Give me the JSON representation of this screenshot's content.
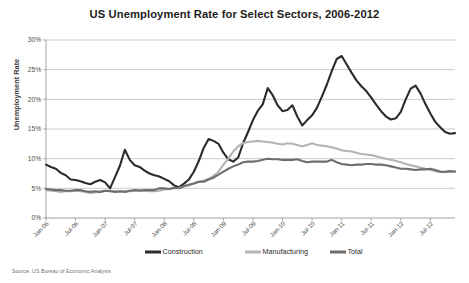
{
  "chart_data": {
    "type": "line",
    "title": "US Unemployment Rate for Select Sectors, 2006-2012",
    "xlabel": "",
    "ylabel": "Unemployment Rate",
    "source": "Source: US Bureau of Economic Analysis",
    "ylim": [
      0,
      30
    ],
    "ytick_labels": [
      "0%",
      "5%",
      "10%",
      "15%",
      "20%",
      "25%",
      "30%"
    ],
    "ytick_values": [
      0,
      5,
      10,
      15,
      20,
      25,
      30
    ],
    "grid": true,
    "legend_position": "bottom",
    "x_start": "Jan-06",
    "x_end": "Jul-12",
    "x_step_months": 6,
    "xtick_labels": [
      "Jan-06",
      "Jul-06",
      "Jan-07",
      "Jul-07",
      "Jan-08",
      "Jul-08",
      "Jan-09",
      "Jul-09",
      "Jan-10",
      "Jul-10",
      "Jan-11",
      "Jul-11",
      "Jan-12",
      "Jul-12"
    ],
    "x": [
      "Jan-06",
      "Feb-06",
      "Mar-06",
      "Apr-06",
      "May-06",
      "Jun-06",
      "Jul-06",
      "Aug-06",
      "Sep-06",
      "Oct-06",
      "Nov-06",
      "Dec-06",
      "Jan-07",
      "Feb-07",
      "Mar-07",
      "Apr-07",
      "May-07",
      "Jun-07",
      "Jul-07",
      "Aug-07",
      "Sep-07",
      "Oct-07",
      "Nov-07",
      "Dec-07",
      "Jan-08",
      "Feb-08",
      "Mar-08",
      "Apr-08",
      "May-08",
      "Jun-08",
      "Jul-08",
      "Aug-08",
      "Sep-08",
      "Oct-08",
      "Nov-08",
      "Dec-08",
      "Jan-09",
      "Feb-09",
      "Mar-09",
      "Apr-09",
      "May-09",
      "Jun-09",
      "Jul-09",
      "Aug-09",
      "Sep-09",
      "Oct-09",
      "Nov-09",
      "Dec-09",
      "Jan-10",
      "Feb-10",
      "Mar-10",
      "Apr-10",
      "May-10",
      "Jun-10",
      "Jul-10",
      "Aug-10",
      "Sep-10",
      "Oct-10",
      "Nov-10",
      "Dec-10",
      "Jan-11",
      "Feb-11",
      "Mar-11",
      "Apr-11",
      "May-11",
      "Jun-11",
      "Jul-11",
      "Aug-11",
      "Sep-11",
      "Oct-11",
      "Nov-11",
      "Dec-11",
      "Jan-12",
      "Feb-12",
      "Mar-12",
      "Apr-12",
      "May-12",
      "Jun-12",
      "Jul-12",
      "Aug-12",
      "Sep-12",
      "Oct-12",
      "Nov-12",
      "Dec-12"
    ],
    "series": [
      {
        "name": "Construction",
        "color": "#2b2b2b",
        "width": 2.1,
        "values": [
          9.0,
          8.6,
          8.3,
          7.6,
          7.2,
          6.5,
          6.4,
          6.2,
          5.9,
          5.7,
          6.1,
          6.4,
          6.0,
          5.0,
          6.9,
          8.8,
          11.5,
          9.8,
          8.9,
          8.6,
          8.0,
          7.5,
          7.2,
          7.0,
          6.6,
          6.2,
          5.5,
          5.2,
          5.8,
          6.5,
          7.8,
          9.6,
          11.8,
          13.3,
          13.0,
          12.5,
          11.0,
          9.9,
          9.5,
          10.2,
          12.6,
          14.5,
          16.5,
          18.1,
          19.2,
          21.9,
          20.7,
          19.0,
          18.0,
          18.2,
          19.0,
          17.1,
          15.6,
          16.5,
          17.3,
          18.6,
          20.5,
          22.5,
          24.8,
          26.8,
          27.3,
          25.9,
          24.5,
          23.2,
          22.2,
          21.4,
          20.3,
          19.1,
          18.0,
          17.1,
          16.6,
          16.8,
          17.9,
          20.0,
          21.8,
          22.3,
          21.0,
          19.2,
          17.6,
          16.2,
          15.3,
          14.5,
          14.2,
          14.3
        ]
      },
      {
        "name": "Manufacturing",
        "color": "#b4b4b4",
        "width": 2.1,
        "values": [
          4.7,
          4.6,
          4.5,
          4.4,
          4.5,
          4.5,
          4.6,
          4.5,
          4.4,
          4.2,
          4.3,
          4.4,
          4.6,
          4.6,
          4.5,
          4.4,
          4.5,
          4.5,
          4.6,
          4.7,
          4.6,
          4.5,
          4.5,
          4.6,
          4.8,
          4.9,
          5.0,
          5.1,
          5.3,
          5.5,
          5.8,
          6.1,
          6.3,
          6.6,
          7.1,
          7.8,
          9.0,
          10.0,
          11.2,
          12.1,
          12.6,
          12.8,
          12.9,
          13.0,
          12.9,
          12.8,
          12.7,
          12.5,
          12.4,
          12.6,
          12.5,
          12.3,
          12.1,
          12.3,
          12.6,
          12.3,
          12.2,
          12.1,
          11.9,
          11.7,
          11.4,
          11.3,
          11.2,
          11.0,
          10.8,
          10.7,
          10.6,
          10.4,
          10.2,
          10.0,
          9.8,
          9.6,
          9.4,
          9.1,
          8.9,
          8.7,
          8.5,
          8.3,
          8.1,
          7.9,
          7.8,
          7.7,
          7.8,
          7.9
        ]
      },
      {
        "name": "Total",
        "color": "#6e6e6e",
        "width": 2.1,
        "values": [
          4.9,
          4.8,
          4.7,
          4.7,
          4.6,
          4.6,
          4.7,
          4.7,
          4.5,
          4.4,
          4.5,
          4.4,
          4.6,
          4.5,
          4.4,
          4.5,
          4.4,
          4.6,
          4.7,
          4.6,
          4.7,
          4.7,
          4.7,
          5.0,
          5.0,
          4.9,
          5.1,
          5.0,
          5.4,
          5.6,
          5.8,
          6.1,
          6.1,
          6.5,
          6.8,
          7.3,
          7.8,
          8.3,
          8.7,
          9.0,
          9.4,
          9.5,
          9.5,
          9.6,
          9.8,
          10.0,
          9.9,
          9.9,
          9.8,
          9.8,
          9.8,
          9.9,
          9.6,
          9.4,
          9.5,
          9.5,
          9.5,
          9.5,
          9.8,
          9.4,
          9.1,
          9.0,
          8.9,
          9.0,
          9.0,
          9.1,
          9.1,
          9.0,
          9.0,
          8.9,
          8.7,
          8.5,
          8.3,
          8.3,
          8.2,
          8.1,
          8.2,
          8.2,
          8.3,
          8.1,
          7.8,
          7.8,
          7.9,
          7.8
        ]
      }
    ]
  }
}
